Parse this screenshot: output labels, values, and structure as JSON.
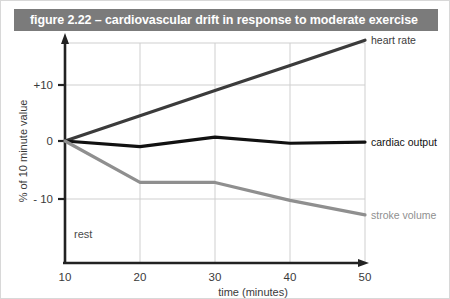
{
  "figure": {
    "title": "figure 2.22 – cardiovascular drift in response to moderate exercise",
    "title_bar_color": "#7b7b7b",
    "background_color": "#ffffff"
  },
  "annotations": {
    "rest": "rest"
  },
  "chart_data": {
    "type": "line",
    "title": "figure 2.22 – cardiovascular drift in response to moderate exercise",
    "xlabel": "time (minutes)",
    "ylabel": "% of 10 minute value",
    "x": [
      10,
      20,
      30,
      40,
      50
    ],
    "xticklabels": [
      "10",
      "20",
      "30",
      "40",
      "50"
    ],
    "yticks": [
      10,
      0,
      -10
    ],
    "yticklabels": [
      "+10",
      "0",
      "- 10"
    ],
    "xlim": [
      10,
      50
    ],
    "ylim": [
      -18,
      20
    ],
    "grid": true,
    "legend_position": "right-inline",
    "series": [
      {
        "name": "heart rate",
        "color": "#3b3b3b",
        "width": 3.2,
        "values": [
          0,
          4.5,
          9,
          13.5,
          18
        ]
      },
      {
        "name": "cardiac output",
        "color": "#111111",
        "width": 3.2,
        "values": [
          0,
          -1.0,
          0.7,
          -0.4,
          -0.2
        ]
      },
      {
        "name": "stroke volume",
        "color": "#8f8f8f",
        "width": 3.2,
        "values": [
          0,
          -7.4,
          -7.4,
          -10.6,
          -13.2
        ]
      }
    ]
  },
  "axes": {
    "x_title": "time (minutes)",
    "y_title": "% of 10 minute value",
    "x_ticks": [
      "10",
      "20",
      "30",
      "40",
      "50"
    ],
    "y_ticks": [
      "+10",
      "0",
      "- 10"
    ],
    "axis_color": "#222222",
    "grid_color": "#cfcfcf"
  }
}
